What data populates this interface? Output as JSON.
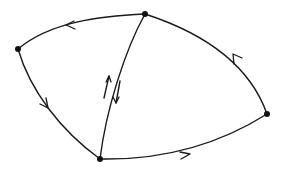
{
  "diagram": {
    "type": "directed-graph",
    "nodes": [
      {
        "id": "top",
        "x": 145,
        "y": 14
      },
      {
        "id": "left",
        "x": 18,
        "y": 49
      },
      {
        "id": "bottom",
        "x": 100,
        "y": 159
      },
      {
        "id": "right",
        "x": 267,
        "y": 114
      }
    ],
    "edges": [
      {
        "from": "top",
        "to": "left",
        "arrow": "single"
      },
      {
        "from": "left",
        "to": "bottom",
        "arrow": "single"
      },
      {
        "from": "bottom",
        "to": "right",
        "arrow": "single"
      },
      {
        "from": "right",
        "to": "top",
        "arrow": "single"
      },
      {
        "from": "bottom",
        "to": "top",
        "arrow": "bidirectional-parallel"
      }
    ],
    "colors": {
      "stroke": "#1a1a1a",
      "node": "#111111",
      "background": "#ffffff"
    }
  }
}
